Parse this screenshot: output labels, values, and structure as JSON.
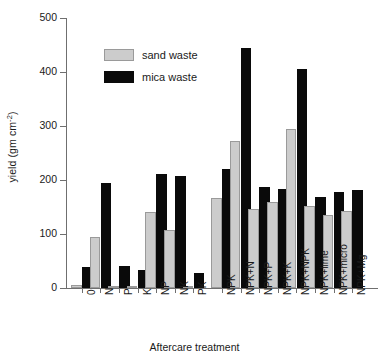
{
  "chart_data": {
    "type": "bar",
    "title": "",
    "xlabel": "Aftercare treatment",
    "ylabel": "yield (gm cm",
    "ylabel_sup": "-2",
    "ylabel_tail": ")",
    "ylim": [
      0,
      500
    ],
    "yticks": [
      0,
      100,
      200,
      300,
      400,
      500
    ],
    "ytick_labels": [
      "0",
      "100",
      "200",
      "300",
      "400",
      "500"
    ],
    "grid": false,
    "legend_position": "upper-left-inside",
    "categories": [
      "0",
      "N",
      "P",
      "K",
      "NP",
      "NK",
      "PK",
      "NPK",
      "NPK+N",
      "NPK+P",
      "NPK+K",
      "NPK+NPK",
      "NPK+lime",
      "NPK+micro",
      "NPK+Mg"
    ],
    "group_gap_after_index": 6,
    "series": [
      {
        "name": "sand waste",
        "color": "#cccccc",
        "values": [
          5,
          95,
          4,
          4,
          141,
          108,
          4,
          166,
          273,
          147,
          160,
          295,
          152,
          135,
          142
        ]
      },
      {
        "name": "mica waste",
        "color": "#0a0a0a",
        "values": [
          38,
          195,
          40,
          33,
          211,
          207,
          27,
          220,
          445,
          187,
          184,
          405,
          168,
          178,
          181
        ]
      }
    ]
  },
  "legend": {
    "items": [
      {
        "label": "sand waste",
        "swatch": "sand"
      },
      {
        "label": "mica waste",
        "swatch": "mica"
      }
    ]
  }
}
